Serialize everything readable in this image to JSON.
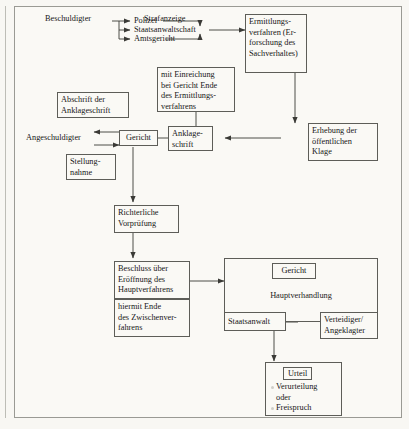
{
  "diagram": {
    "labels": {
      "beschuldigter": "Beschuldigter",
      "strafanzeige": "Strafanzeige",
      "polizei": "Polizei",
      "staatsanwaltschaft": "Staatsanwaltschaft",
      "amtsgericht": "Amtsgericht",
      "angeschuldigter": "Angeschuldigter"
    },
    "boxes": {
      "ermittlungsverfahren": "Ermittlungs-\nverfahren (Er-\nforschung des\nSachverhaltes)",
      "mit_einreichung": "mit Einreichung\nbei Gericht Ende\ndes Ermittlungs-\nverfahrens",
      "abschrift": "Abschrift der\nAnklageschrift",
      "gericht": "Gericht",
      "anklageschrift": "Anklage-\nschrift",
      "erhebung": "Erhebung der\nöffentlichen\nKlage",
      "stellungnahme": "Stellung-\nnahme",
      "richterliche": "Richterliche\nVorprüfung",
      "beschluss": "Beschluss über\nEröffnung des\nHauptverfahrens",
      "hiermit_ende": "hiermit Ende\ndes Zwischenver-\nfahrens",
      "gericht_haupt": "Gericht",
      "hauptverhandlung": "Hauptverhandlung",
      "staatsanwalt": "Staatsanwalt",
      "verteidiger": "Verteidiger/\nAngeklagter"
    },
    "urteil": {
      "badge": "Urteil",
      "option_1": "Verurteilung",
      "conjunction": "oder",
      "option_2": "Freispruch"
    },
    "colors": {
      "page_background": "#f8f7f3",
      "frame_background": "#faf9f5",
      "border": "#5d5d58",
      "frame_border": "#9a9a94",
      "text": "#171717",
      "wire": "#3a3a36"
    }
  }
}
